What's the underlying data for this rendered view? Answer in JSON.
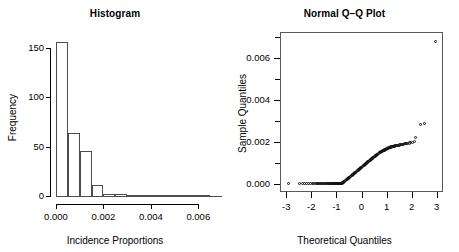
{
  "chart_data": [
    {
      "type": "bar",
      "title": "Histogram",
      "xlabel": "Incidence Proportions",
      "ylabel": "Frequency",
      "grid": false,
      "legend": null,
      "xlim": [
        0.0,
        0.007
      ],
      "ylim": [
        0,
        160
      ],
      "xticks": [
        0.0,
        0.002,
        0.004,
        0.006
      ],
      "xtick_labels": [
        "0.000",
        "0.002",
        "0.004",
        "0.006"
      ],
      "yticks": [
        0,
        50,
        100,
        150
      ],
      "ytick_labels": [
        "0",
        "50",
        "100",
        "150"
      ],
      "bin_width": 0.0005,
      "bin_edges": [
        0.0,
        0.0005,
        0.001,
        0.0015,
        0.002,
        0.0025,
        0.003,
        0.0065,
        0.007
      ],
      "categories": [
        "0.0000-0.0005",
        "0.0005-0.0010",
        "0.0010-0.0015",
        "0.0015-0.0020",
        "0.0020-0.0025",
        "0.0025-0.0030",
        "0.0065-0.0070"
      ],
      "values": [
        156,
        64,
        46,
        11,
        2,
        2,
        1
      ]
    },
    {
      "type": "scatter",
      "title": "Normal Q–Q Plot",
      "xlabel": "Theoretical Quantiles",
      "ylabel": "Sample Quantiles",
      "grid": false,
      "legend": null,
      "frame": "box",
      "xlim": [
        -3.25,
        3.25
      ],
      "ylim": [
        -0.0004,
        0.00725
      ],
      "xticks": [
        -3,
        -2,
        -1,
        0,
        1,
        2,
        3
      ],
      "xtick_labels": [
        "-3",
        "-2",
        "-1",
        "0",
        "1",
        "2",
        "3"
      ],
      "yticks": [
        0.0,
        0.002,
        0.004,
        0.006
      ],
      "ytick_labels": [
        "0.000",
        "0.002",
        "0.004",
        "0.006"
      ],
      "yticks_minor": [
        0.001,
        0.003,
        0.005,
        0.007
      ],
      "marker": "open-circle",
      "points": [
        [
          -2.9,
          0.0
        ],
        [
          -2.48,
          0.0
        ],
        [
          -2.34,
          0.0
        ],
        [
          -2.26,
          0.0
        ],
        [
          -2.18,
          0.0
        ],
        [
          -2.1,
          0.0
        ],
        [
          -2.03,
          0.0
        ],
        [
          -1.97,
          0.0
        ],
        [
          -1.91,
          0.0
        ],
        [
          -1.85,
          0.0
        ],
        [
          -1.8,
          0.0
        ],
        [
          -1.75,
          0.0
        ],
        [
          -1.7,
          0.0
        ],
        [
          -1.66,
          0.0
        ],
        [
          -1.62,
          0.0
        ],
        [
          -1.58,
          0.0
        ],
        [
          -1.54,
          0.0
        ],
        [
          -1.5,
          0.0
        ],
        [
          -1.46,
          0.0
        ],
        [
          -1.43,
          0.0
        ],
        [
          -1.39,
          0.0
        ],
        [
          -1.36,
          0.0
        ],
        [
          -1.33,
          0.0
        ],
        [
          -1.3,
          0.0
        ],
        [
          -1.27,
          0.0
        ],
        [
          -1.24,
          0.0
        ],
        [
          -1.21,
          0.0
        ],
        [
          -1.18,
          0.0
        ],
        [
          -1.15,
          0.0
        ],
        [
          -1.12,
          0.0
        ],
        [
          -1.1,
          0.0
        ],
        [
          -1.07,
          0.0
        ],
        [
          -1.04,
          0.0
        ],
        [
          -1.02,
          0.0
        ],
        [
          -0.99,
          0.0
        ],
        [
          -0.97,
          0.0
        ],
        [
          -0.94,
          0.0
        ],
        [
          -0.92,
          0.0
        ],
        [
          -0.9,
          0.0
        ],
        [
          -0.87,
          0.0
        ],
        [
          -0.85,
          0.0
        ],
        [
          -0.83,
          0.0
        ],
        [
          -0.8,
          0.0
        ],
        [
          -0.78,
          2e-05
        ],
        [
          -0.76,
          4e-05
        ],
        [
          -0.74,
          6e-05
        ],
        [
          -0.72,
          8e-05
        ],
        [
          -0.69,
          0.0001
        ],
        [
          -0.67,
          0.00012
        ],
        [
          -0.65,
          0.00014
        ],
        [
          -0.63,
          0.00016
        ],
        [
          -0.61,
          0.00018
        ],
        [
          -0.59,
          0.0002
        ],
        [
          -0.57,
          0.00021
        ],
        [
          -0.55,
          0.00023
        ],
        [
          -0.53,
          0.00025
        ],
        [
          -0.51,
          0.00027
        ],
        [
          -0.49,
          0.00029
        ],
        [
          -0.47,
          0.00031
        ],
        [
          -0.45,
          0.00033
        ],
        [
          -0.43,
          0.00035
        ],
        [
          -0.41,
          0.00037
        ],
        [
          -0.39,
          0.00039
        ],
        [
          -0.37,
          0.00041
        ],
        [
          -0.35,
          0.00043
        ],
        [
          -0.33,
          0.00045
        ],
        [
          -0.31,
          0.00047
        ],
        [
          -0.29,
          0.00049
        ],
        [
          -0.27,
          0.00051
        ],
        [
          -0.25,
          0.00053
        ],
        [
          -0.23,
          0.00055
        ],
        [
          -0.21,
          0.00057
        ],
        [
          -0.19,
          0.00059
        ],
        [
          -0.17,
          0.00061
        ],
        [
          -0.15,
          0.00063
        ],
        [
          -0.13,
          0.00065
        ],
        [
          -0.11,
          0.00067
        ],
        [
          -0.09,
          0.00069
        ],
        [
          -0.07,
          0.00071
        ],
        [
          -0.05,
          0.00073
        ],
        [
          -0.03,
          0.00075
        ],
        [
          -0.01,
          0.00077
        ],
        [
          0.01,
          0.00079
        ],
        [
          0.03,
          0.00081
        ],
        [
          0.05,
          0.00083
        ],
        [
          0.07,
          0.00085
        ],
        [
          0.09,
          0.00087
        ],
        [
          0.11,
          0.00089
        ],
        [
          0.13,
          0.00091
        ],
        [
          0.15,
          0.00093
        ],
        [
          0.17,
          0.00095
        ],
        [
          0.19,
          0.00097
        ],
        [
          0.21,
          0.00099
        ],
        [
          0.23,
          0.00101
        ],
        [
          0.25,
          0.00103
        ],
        [
          0.27,
          0.00105
        ],
        [
          0.29,
          0.00107
        ],
        [
          0.31,
          0.00109
        ],
        [
          0.33,
          0.00111
        ],
        [
          0.35,
          0.00113
        ],
        [
          0.37,
          0.00115
        ],
        [
          0.39,
          0.00117
        ],
        [
          0.41,
          0.00119
        ],
        [
          0.43,
          0.00121
        ],
        [
          0.45,
          0.00123
        ],
        [
          0.47,
          0.00124
        ],
        [
          0.49,
          0.00126
        ],
        [
          0.51,
          0.00128
        ],
        [
          0.53,
          0.0013
        ],
        [
          0.55,
          0.00132
        ],
        [
          0.57,
          0.00134
        ],
        [
          0.59,
          0.00136
        ],
        [
          0.61,
          0.00138
        ],
        [
          0.63,
          0.00139
        ],
        [
          0.65,
          0.00141
        ],
        [
          0.67,
          0.00143
        ],
        [
          0.69,
          0.00145
        ],
        [
          0.72,
          0.00147
        ],
        [
          0.74,
          0.00148
        ],
        [
          0.76,
          0.0015
        ],
        [
          0.78,
          0.00152
        ],
        [
          0.8,
          0.00153
        ],
        [
          0.83,
          0.00155
        ],
        [
          0.85,
          0.00157
        ],
        [
          0.87,
          0.00158
        ],
        [
          0.9,
          0.0016
        ],
        [
          0.92,
          0.00161
        ],
        [
          0.94,
          0.00163
        ],
        [
          0.97,
          0.00164
        ],
        [
          0.99,
          0.00166
        ],
        [
          1.02,
          0.00167
        ],
        [
          1.04,
          0.00169
        ],
        [
          1.07,
          0.0017
        ],
        [
          1.1,
          0.00171
        ],
        [
          1.12,
          0.00173
        ],
        [
          1.15,
          0.00174
        ],
        [
          1.18,
          0.00175
        ],
        [
          1.21,
          0.00176
        ],
        [
          1.24,
          0.00177
        ],
        [
          1.27,
          0.00178
        ],
        [
          1.3,
          0.00179
        ],
        [
          1.33,
          0.0018
        ],
        [
          1.36,
          0.00181
        ],
        [
          1.39,
          0.00182
        ],
        [
          1.43,
          0.00183
        ],
        [
          1.46,
          0.00184
        ],
        [
          1.5,
          0.00185
        ],
        [
          1.54,
          0.00186
        ],
        [
          1.58,
          0.00187
        ],
        [
          1.62,
          0.00188
        ],
        [
          1.66,
          0.00189
        ],
        [
          1.7,
          0.0019
        ],
        [
          1.75,
          0.00191
        ],
        [
          1.8,
          0.00192
        ],
        [
          1.85,
          0.00193
        ],
        [
          1.91,
          0.00194
        ],
        [
          1.97,
          0.00196
        ],
        [
          2.03,
          0.00198
        ],
        [
          2.1,
          0.002
        ],
        [
          2.14,
          0.00222
        ],
        [
          2.34,
          0.00281
        ],
        [
          2.52,
          0.00289
        ],
        [
          2.96,
          0.00681
        ]
      ]
    }
  ]
}
